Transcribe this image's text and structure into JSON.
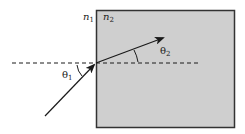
{
  "diagram": {
    "labels": {
      "n1": "n",
      "n1_sub": "1",
      "n2": "n",
      "n2_sub": "2",
      "theta1": "θ",
      "theta1_sub": "1",
      "theta2": "θ",
      "theta2_sub": "2"
    },
    "colors": {
      "medium2_fill": "#cfcfcf",
      "border": "#333333",
      "ray": "#1a1a1a",
      "background": "#ffffff"
    }
  }
}
